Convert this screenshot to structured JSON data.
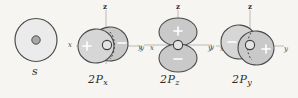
{
  "figure": {
    "background_color": "#f6f5f2",
    "ink_color": "#3a3a3a",
    "lobe_fill": "#c9c9c9",
    "sphere_fill": "#ebebeb"
  },
  "orbitals": [
    {
      "id": "s",
      "label": "s",
      "shape": "sphere",
      "axes": [],
      "signs": []
    },
    {
      "id": "2px",
      "label_main": "2P",
      "label_sub": "x",
      "label_full": "2Px",
      "shape": "two-lobes-horizontal",
      "axes": [
        {
          "name": "z",
          "position": "top"
        },
        {
          "name": "x",
          "position": "left"
        },
        {
          "name": "y",
          "position": "right"
        }
      ],
      "signs": [
        {
          "symbol": "+",
          "position": "left-lobe"
        },
        {
          "symbol": "−",
          "position": "right-lobe"
        }
      ]
    },
    {
      "id": "2pz",
      "label_main": "2P",
      "label_sub": "z",
      "label_full": "2Pz",
      "shape": "two-lobes-vertical",
      "axes": [
        {
          "name": "z",
          "position": "top"
        },
        {
          "name": "y",
          "position": "far-left"
        },
        {
          "name": "x",
          "position": "left"
        },
        {
          "name": "y",
          "position": "right"
        }
      ],
      "signs": [
        {
          "symbol": "+",
          "position": "top-lobe"
        },
        {
          "symbol": "−",
          "position": "bottom-lobe"
        }
      ]
    },
    {
      "id": "2py",
      "label_main": "2P",
      "label_sub": "y",
      "label_full": "2Py",
      "shape": "two-lobes-horizontal",
      "axes": [
        {
          "name": "z",
          "position": "top"
        },
        {
          "name": "y",
          "position": "far-left"
        },
        {
          "name": "x",
          "position": "left"
        },
        {
          "name": "y",
          "position": "right"
        }
      ],
      "signs": [
        {
          "symbol": "−",
          "position": "left-lobe"
        },
        {
          "symbol": "+",
          "position": "right-lobe"
        }
      ]
    }
  ]
}
